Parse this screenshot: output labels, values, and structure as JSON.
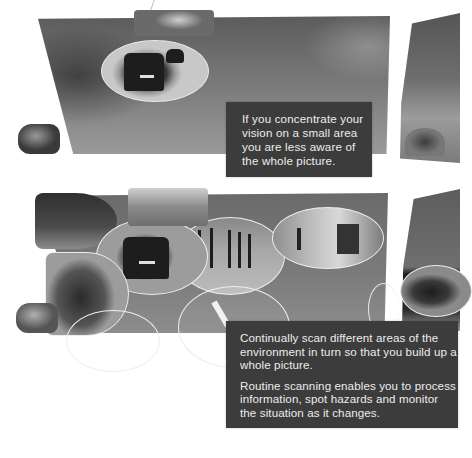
{
  "panels": [
    {
      "id": "narrow-focus",
      "description_caption": "If you concentrate your vision on a small area you are less aware of the whole picture.",
      "caption_lines": [
        "If you concentrate your",
        "vision on a small area",
        "you are less aware of",
        "the whole picture."
      ],
      "scene": "windshield view with a single small oval focus on the car ahead"
    },
    {
      "id": "scanning",
      "paragraphs": [
        "Continually scan different areas of the environment in turn so that you build up a whole picture.",
        "Routine scanning enables you to process information, spot hazards and monitor the situation as it changes."
      ],
      "scene": "windshield view with multiple oval scan areas: building, street ahead, car ahead, bollards, pedestrian, parked car, road, side mirror car"
    }
  ],
  "colors": {
    "caption_box_bg": "#3c3c3c",
    "caption_text": "#ececec",
    "windshield_tone": "#6e6e6e",
    "scan_ring": "#ededed"
  }
}
